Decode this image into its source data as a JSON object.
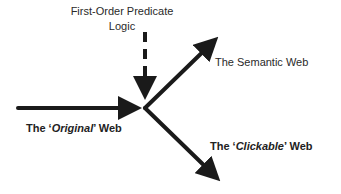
{
  "diagram": {
    "nodes": {
      "predicate_logic": {
        "line1": "First-Order Predicate",
        "line2": "Logic"
      },
      "semantic_web": {
        "label": "The Semantic Web"
      },
      "original_web": {
        "prefix": "The ‘",
        "emph": "Original",
        "suffix": "’ Web"
      },
      "clickable_web": {
        "prefix": "The ‘",
        "emph": "Clickable",
        "suffix": "’ Web"
      }
    },
    "edges": [
      {
        "from": "original_web",
        "to": "junction",
        "style": "solid"
      },
      {
        "from": "predicate_logic",
        "to": "junction",
        "style": "dashed"
      },
      {
        "from": "junction",
        "to": "semantic_web",
        "style": "solid"
      },
      {
        "from": "junction",
        "to": "clickable_web",
        "style": "solid"
      }
    ],
    "colors": {
      "arrow": "#1a1a1a",
      "text": "#2a2a2a"
    }
  }
}
